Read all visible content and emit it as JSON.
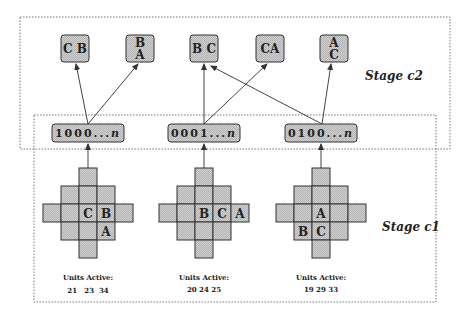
{
  "stages": {
    "c2_label": "Stage c2",
    "c1_label": "Stage c1"
  },
  "stage_c2_nodes": [
    {
      "id": "CB",
      "lines": [
        "C B"
      ]
    },
    {
      "id": "BA",
      "lines": [
        "B",
        "A"
      ]
    },
    {
      "id": "BC",
      "lines": [
        "B C"
      ]
    },
    {
      "id": "CA",
      "lines": [
        "CA"
      ]
    },
    {
      "id": "AC",
      "lines": [
        "A",
        "C"
      ]
    }
  ],
  "codes": [
    {
      "label": "1000...n",
      "prefix": "1000...",
      "suffix": "n"
    },
    {
      "label": "0001...n",
      "prefix": "0001...",
      "suffix": "n"
    },
    {
      "label": "0100...n",
      "prefix": "0100...",
      "suffix": "n"
    }
  ],
  "connections": [
    {
      "from": "1000...n",
      "to": "CB"
    },
    {
      "from": "1000...n",
      "to": "BA"
    },
    {
      "from": "0001...n",
      "to": "BC"
    },
    {
      "from": "0001...n",
      "to": "CA"
    },
    {
      "from": "0100...n",
      "to": "BC"
    },
    {
      "from": "0100...n",
      "to": "AC"
    }
  ],
  "grids": [
    {
      "cell_labels": [
        {
          "row": 2,
          "col": 2,
          "text": "C"
        },
        {
          "row": 2,
          "col": 3,
          "text": "B"
        },
        {
          "row": 3,
          "col": 3,
          "text": "A"
        }
      ],
      "units_title": "Units Active:",
      "units_values": "21   23  34"
    },
    {
      "cell_labels": [
        {
          "row": 2,
          "col": 2,
          "text": "B"
        },
        {
          "row": 2,
          "col": 3,
          "text": "C"
        },
        {
          "row": 2,
          "col": 4,
          "text": "A"
        }
      ],
      "units_title": "Units Active:",
      "units_values": "20 24 25"
    },
    {
      "cell_labels": [
        {
          "row": 2,
          "col": 2,
          "text": "A"
        },
        {
          "row": 3,
          "col": 1,
          "text": "B"
        },
        {
          "row": 3,
          "col": 2,
          "text": "C"
        }
      ],
      "units_title": "Units Active:",
      "units_values": "19 29 33"
    }
  ]
}
